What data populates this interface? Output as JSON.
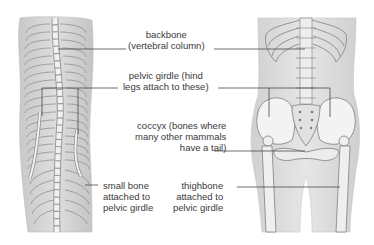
{
  "figure": {
    "left_panel": {
      "subject": "snake skeleton with vestigial pelvic bones"
    },
    "right_panel": {
      "subject": "human skeleton torso and pelvis"
    },
    "labels": {
      "backbone": {
        "line1": "backbone",
        "line2": "(vertebral column)"
      },
      "pelvic_girdle": {
        "line1": "pelvic girdle (hind",
        "line2": "legs attach to these)"
      },
      "coccyx": {
        "line1": "coccyx (bones where",
        "line2": "many other mammals",
        "line3": "have a tail)"
      },
      "small_bone": {
        "line1": "small bone",
        "line2": "attached to",
        "line3": "pelvic girdle"
      },
      "thighbone": {
        "line1": "thighbone",
        "line2": "attached to",
        "line3": "pelvic girdle"
      }
    },
    "colors": {
      "background": "#ffffff",
      "body_fill": "#d9d9d9",
      "bone_fill": "#f2f2f2",
      "bone_stroke": "#8a8a8a",
      "leader_line": "#4a4a4a",
      "text": "#3a3a3a"
    }
  }
}
